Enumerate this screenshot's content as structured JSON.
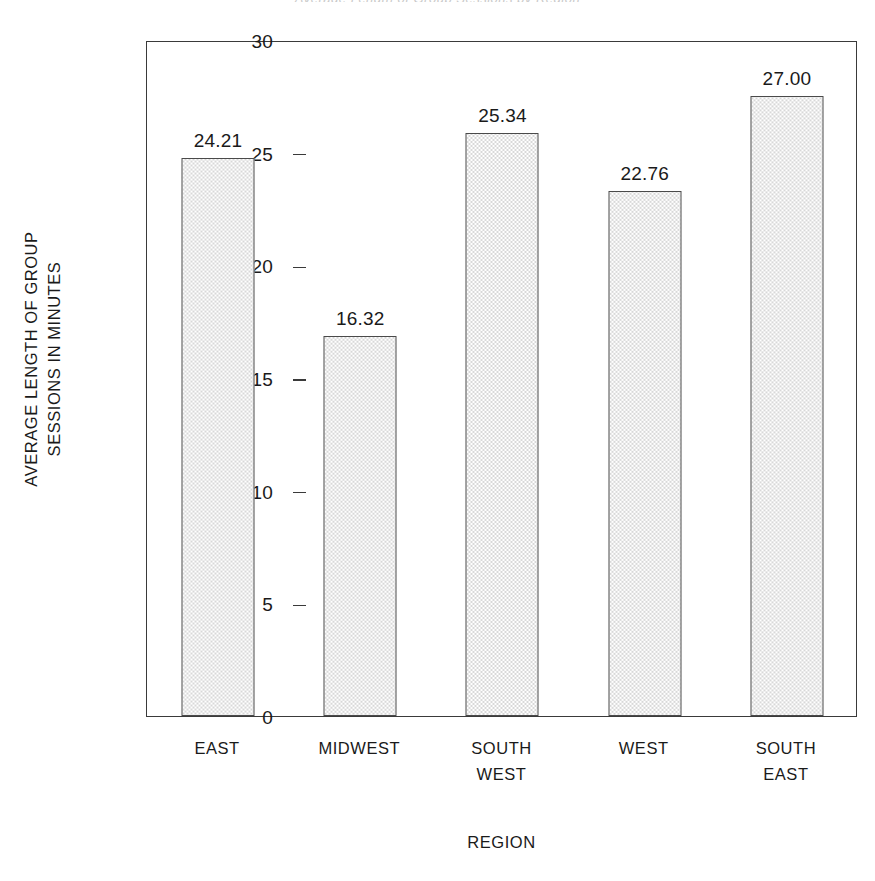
{
  "chart_data": {
    "type": "bar",
    "title": "",
    "categories": [
      "EAST",
      "MIDWEST",
      "SOUTH\nWEST",
      "WEST",
      "SOUTH\nEAST"
    ],
    "values": [
      24.21,
      16.32,
      25.34,
      22.76,
      27.0
    ],
    "value_labels": [
      "24.21",
      "16.32",
      "25.34",
      "22.76",
      "27.00"
    ],
    "xlabel": "REGION",
    "ylabel": "AVERAGE LENGTH OF GROUP\nSESSIONS IN MINUTES",
    "ylim": [
      0,
      30
    ],
    "ytick_labels": [
      "0",
      "5",
      "10",
      "15",
      "20",
      "25",
      "30"
    ],
    "ytick_values": [
      0,
      5,
      10,
      15,
      20,
      25,
      30
    ],
    "grid": false,
    "legend": false,
    "bar_fill_color": "#ececec",
    "bar_border_color": "#4a4a4a",
    "axis_color": "#3a3a3a",
    "text_color": "#1a1a1a",
    "background_color": "#ffffff"
  },
  "artifacts": {
    "top_clipped_line": "Average Length of Group Sessions by Region"
  }
}
